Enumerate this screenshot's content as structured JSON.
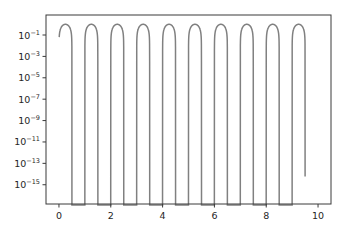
{
  "chart_data": {
    "type": "line",
    "title": "",
    "xlabel": "",
    "ylabel": "",
    "yscale": "log",
    "xlim": [
      -0.5,
      10.5
    ],
    "ylim_log10": [
      -16.8,
      0.87
    ],
    "grid": false,
    "legend": null,
    "x_ticks": [
      0,
      2,
      4,
      6,
      8,
      10
    ],
    "x_tick_labels": [
      "0",
      "2",
      "4",
      "6",
      "8",
      "10"
    ],
    "y_ticks_log10": [
      -1,
      -3,
      -5,
      -7,
      -9,
      -11,
      -13,
      -15
    ],
    "y_tick_labels": [
      "10^-1",
      "10^-3",
      "10^-5",
      "10^-7",
      "10^-9",
      "10^-11",
      "10^-13",
      "10^-15"
    ],
    "series": [
      {
        "name": "sin(2πx)",
        "color": "#808080",
        "function": "sin(2*pi*x)",
        "x_range": [
          0.01,
          9.5
        ],
        "peaks": [
          0.25,
          1.25,
          2.25,
          3.25,
          4.25,
          5.25,
          6.25,
          7.25,
          8.25,
          9.25
        ],
        "peak_value": 1.0,
        "positive_intervals": [
          [
            0,
            0.5
          ],
          [
            1,
            1.5
          ],
          [
            2,
            2.5
          ],
          [
            3,
            3.5
          ],
          [
            4,
            4.5
          ],
          [
            5,
            5.5
          ],
          [
            6,
            6.5
          ],
          [
            7,
            7.5
          ],
          [
            8,
            8.5
          ],
          [
            9,
            9.5
          ]
        ]
      }
    ]
  },
  "colors": {
    "line": "#808080",
    "axes": "#3a3a3a",
    "text": "#262626",
    "background": "#ffffff"
  }
}
